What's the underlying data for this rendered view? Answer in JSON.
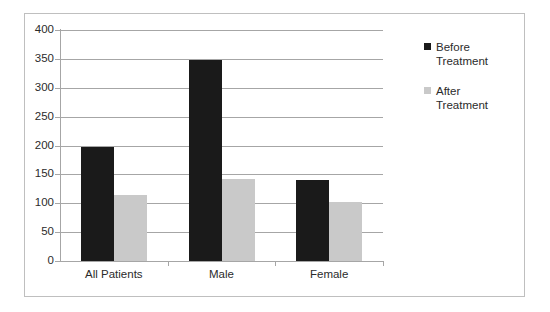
{
  "chart_data": {
    "type": "bar",
    "title": "",
    "xlabel": "",
    "ylabel": "",
    "categories": [
      "All Patients",
      "Male",
      "Female"
    ],
    "series": [
      {
        "name": "Before Treatment",
        "color": "#1a1a1a",
        "values": [
          197,
          348,
          141
        ]
      },
      {
        "name": "After Treatment",
        "color": "#c9c9c9",
        "values": [
          115,
          142,
          102
        ]
      }
    ],
    "ylim": [
      0,
      400
    ],
    "ytick_labels": [
      "400",
      "350",
      "300",
      "250",
      "200",
      "150",
      "100",
      "50",
      "0"
    ],
    "ytick_values": [
      400,
      350,
      300,
      250,
      200,
      150,
      100,
      50,
      0
    ],
    "grid": true,
    "legend_position": "right"
  },
  "legend": {
    "entries": [
      {
        "label_line1": "Before",
        "label_line2": "Treatment",
        "color": "#1a1a1a"
      },
      {
        "label_line1": "After",
        "label_line2": "Treatment",
        "color": "#c9c9c9"
      }
    ]
  },
  "colors": {
    "before": "#1a1a1a",
    "after": "#c9c9c9",
    "grid": "#a6a6a6",
    "frame": "#bfbfbf",
    "text": "#2b2b2b",
    "background": "#ffffff"
  }
}
